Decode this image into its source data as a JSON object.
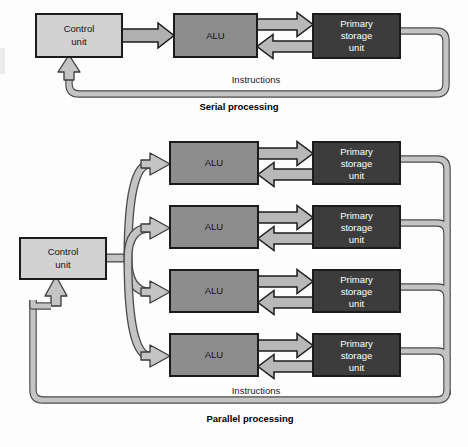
{
  "figure": {
    "background_color": "#fdfdfd"
  },
  "colors": {
    "control_unit_fill": "#d2d2d2",
    "alu_fill": "#8d8d8d",
    "storage_fill": "#3c3c3c",
    "box_stroke": "#1b1b1b",
    "arrow_fill": "#b8b8b8",
    "arrow_stroke": "#1b1b1b",
    "bus_fill": "#c4c4c4",
    "bus_stroke": "#4a4a4a",
    "text_on_light": "#111111",
    "text_on_dark": "#ffffff"
  },
  "serial": {
    "caption": "Serial processing",
    "bus_label": "Instructions",
    "blocks": {
      "control_unit": {
        "line1": "Control",
        "line2": "unit"
      },
      "alu": {
        "line1": "ALU"
      },
      "storage": {
        "line1": "Primary",
        "line2": "storage",
        "line3": "unit"
      }
    }
  },
  "parallel": {
    "caption": "Parallel processing",
    "bus_label": "Instructions",
    "blocks": {
      "control_unit": {
        "line1": "Control",
        "line2": "unit"
      }
    },
    "lanes": [
      {
        "index": 1,
        "alu": {
          "line1": "ALU"
        },
        "storage": {
          "line1": "Primary",
          "line2": "storage",
          "line3": "unit"
        }
      },
      {
        "index": 2,
        "alu": {
          "line1": "ALU"
        },
        "storage": {
          "line1": "Primary",
          "line2": "storage",
          "line3": "unit"
        }
      },
      {
        "index": 3,
        "alu": {
          "line1": "ALU"
        },
        "storage": {
          "line1": "Primary",
          "line2": "storage",
          "line3": "unit"
        }
      },
      {
        "index": 4,
        "alu": {
          "line1": "ALU"
        },
        "storage": {
          "line1": "Primary",
          "line2": "storage",
          "line3": "unit"
        }
      }
    ]
  }
}
